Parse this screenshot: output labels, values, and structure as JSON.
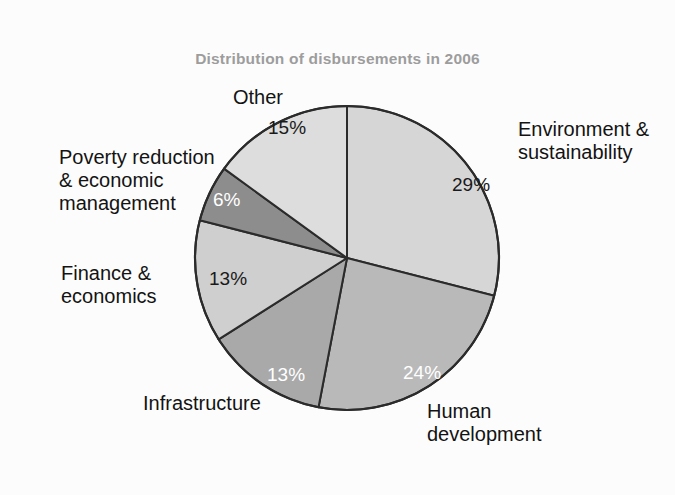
{
  "chart_data": {
    "type": "pie",
    "title": "Distribution of disbursements in 2006",
    "xlabel": "",
    "ylabel": "",
    "legend_position": "none",
    "grid": false,
    "units": "percent",
    "start_angle_deg": 0,
    "direction": "clockwise",
    "categories": [
      "Environment & sustainability",
      "Human development",
      "Infrastructure",
      "Finance & economics",
      "Poverty reduction & economic management",
      "Other"
    ],
    "values": [
      29,
      24,
      13,
      13,
      6,
      15
    ],
    "value_labels": [
      "29%",
      "24%",
      "13%",
      "13%",
      "6%",
      "15%"
    ],
    "slices": [
      {
        "name": "Environment & sustainability",
        "value": 29,
        "value_label": "29%",
        "color": "#d6d6d6",
        "label_lines": [
          "Environment &",
          "sustainability"
        ],
        "value_label_color": "dark"
      },
      {
        "name": "Human development",
        "value": 24,
        "value_label": "24%",
        "color": "#b9b9b9",
        "label_lines": [
          "Human",
          "development"
        ],
        "value_label_color": "light"
      },
      {
        "name": "Infrastructure",
        "value": 13,
        "value_label": "13%",
        "color": "#a9a9a9",
        "label_lines": [
          "Infrastructure"
        ],
        "value_label_color": "light"
      },
      {
        "name": "Finance & economics",
        "value": 13,
        "value_label": "13%",
        "color": "#cfcfcf",
        "label_lines": [
          "Finance &",
          "economics"
        ],
        "value_label_color": "dark"
      },
      {
        "name": "Poverty reduction & economic management",
        "value": 6,
        "value_label": "6%",
        "color": "#8d8d8d",
        "label_lines": [
          "Poverty reduction",
          "& economic",
          "management"
        ],
        "value_label_color": "light"
      },
      {
        "name": "Other",
        "value": 15,
        "value_label": "15%",
        "color": "#dddddd",
        "label_lines": [
          "Other"
        ],
        "value_label_color": "dark"
      }
    ]
  },
  "style": {
    "background": "#fcfcfc",
    "title_color": "#9d9d9d",
    "outline_color": "#2b2b2b",
    "label_color": "#131313"
  }
}
